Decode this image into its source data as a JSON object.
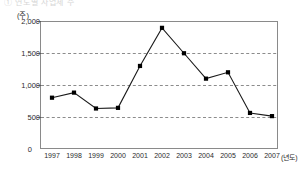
{
  "chart_title": "① 연도별 사업체 수",
  "chart_data": {
    "type": "line",
    "title": "",
    "xlabel": "(년도)",
    "ylabel": "(주)",
    "categories": [
      "1997",
      "1998",
      "1999",
      "2000",
      "2001",
      "2002",
      "2003",
      "2004",
      "2005",
      "2006",
      "2007"
    ],
    "values": [
      800,
      880,
      630,
      640,
      1300,
      1900,
      1500,
      1100,
      1200,
      560,
      510
    ],
    "series": [
      {
        "name": "주식 수",
        "values": [
          800,
          880,
          630,
          640,
          1300,
          1900,
          1500,
          1100,
          1200,
          560,
          510
        ]
      }
    ],
    "ylim": [
      0,
      2000
    ],
    "y_ticks": [
      0,
      500,
      1000,
      1500,
      2000
    ],
    "y_tick_labels": [
      "0",
      "500",
      "1,000",
      "1,500",
      "2,000"
    ],
    "grid": true,
    "grid_style": "dashed-horizontal",
    "legend": "none",
    "marker": "filled-square",
    "line_color": "#1a1a1a",
    "marker_color": "#000000",
    "grid_color": "#8c8c8c",
    "frame_color": "#8a8a8a"
  },
  "axis": {
    "y_unit": "(주)",
    "x_unit": "(년도)",
    "zero_label": "0"
  }
}
